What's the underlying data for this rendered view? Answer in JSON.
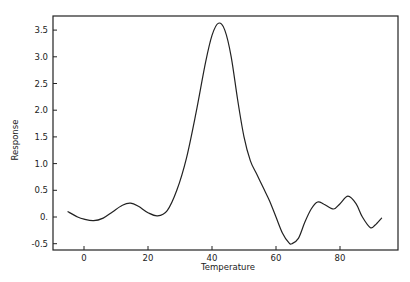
{
  "chart_data": {
    "type": "line",
    "title": "",
    "xlabel": "Temperature",
    "ylabel": "Response",
    "xlim": [
      -10,
      98
    ],
    "ylim": [
      -0.62,
      3.78
    ],
    "xticks": [
      0,
      20,
      40,
      60,
      80
    ],
    "xtick_labels": [
      "0",
      "20",
      "40",
      "60",
      "80"
    ],
    "yticks": [
      -0.5,
      0,
      0.5,
      1.0,
      1.5,
      2.0,
      2.5,
      3.0,
      3.5
    ],
    "ytick_labels": [
      "-0.5",
      "0.",
      "0.5",
      "1.0",
      "1.5",
      "2.0",
      "2.5",
      "3.0",
      "3.5"
    ],
    "grid": false,
    "legend": null,
    "series": [
      {
        "name": "Response",
        "color": "#222222",
        "x": [
          -5,
          -2,
          0,
          3,
          6,
          9,
          12,
          14.5,
          17,
          20,
          23,
          26,
          29,
          32,
          35,
          38,
          40,
          42,
          44,
          46,
          48,
          50,
          52,
          54,
          56,
          58,
          60,
          62,
          64,
          65,
          67,
          69,
          71,
          73,
          75,
          78,
          80,
          82.5,
          85,
          87,
          89.5,
          91,
          93
        ],
        "y": [
          0.1,
          0.0,
          -0.04,
          -0.07,
          -0.02,
          0.1,
          0.22,
          0.26,
          0.2,
          0.08,
          0.02,
          0.12,
          0.5,
          1.1,
          1.95,
          2.9,
          3.4,
          3.63,
          3.5,
          3.0,
          2.2,
          1.5,
          1.05,
          0.8,
          0.55,
          0.3,
          0.0,
          -0.3,
          -0.48,
          -0.5,
          -0.4,
          -0.1,
          0.15,
          0.28,
          0.24,
          0.15,
          0.25,
          0.39,
          0.25,
          0.0,
          -0.2,
          -0.15,
          -0.02
        ]
      }
    ]
  }
}
